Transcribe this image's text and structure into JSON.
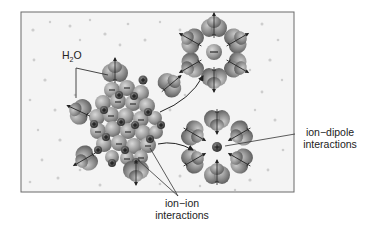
{
  "diagram": {
    "type": "solvation-of-ionic-solid",
    "labels": {
      "water_main": "H",
      "water_sub": "2",
      "water_tail": "O",
      "ion_ion_line1": "ion−ion",
      "ion_ion_line2": "interactions",
      "ion_dipole_line1": "ion−dipole",
      "ion_dipole_line2": "interactions"
    },
    "colors": {
      "background": "#ffffff",
      "box_fill": "#f4f4f4",
      "box_border": "#6a6a6a",
      "water_molecule": "#8c8c8c",
      "ion_sphere": "#9a9a9a",
      "cation": "#3a3a3a",
      "text": "#222222"
    },
    "elements": {
      "ionic_lattice": {
        "center": [
          128,
          130
        ],
        "charges": [
          "+",
          "−"
        ]
      },
      "hydrated_anion": {
        "center": [
          214,
          52
        ],
        "central_charge": "−",
        "water_count": 6
      },
      "hydrated_cation": {
        "center": [
          217,
          147
        ],
        "central_charge": "+",
        "water_count": 6
      }
    }
  }
}
